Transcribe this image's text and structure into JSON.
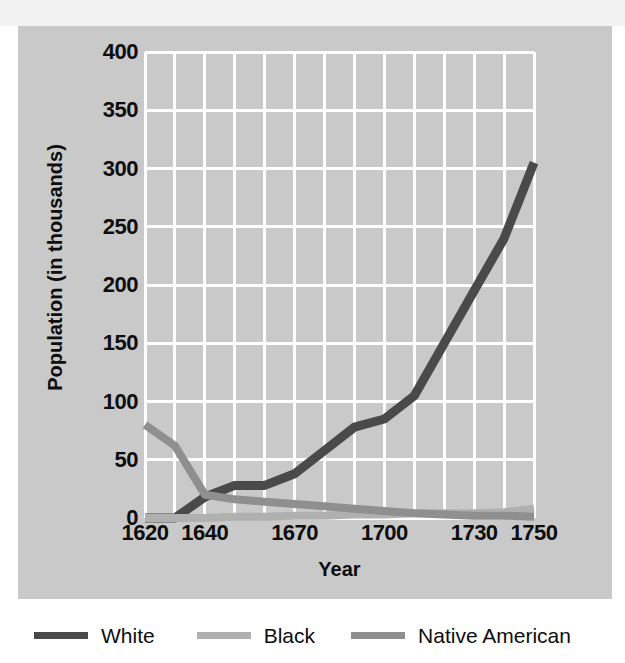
{
  "panel": {
    "background_color": "#c9c9c9",
    "grid_color": "#ffffff",
    "top_band_color": "#f2f2f2"
  },
  "axes": {
    "y_title": "Population (in thousands)",
    "x_title": "Year",
    "y_ticks": [
      "400",
      "350",
      "300",
      "250",
      "200",
      "150",
      "100",
      "50",
      "0"
    ],
    "x_ticks": [
      "1620",
      "1640",
      "1670",
      "1700",
      "1730",
      "1750"
    ]
  },
  "legend": {
    "items": [
      {
        "label": "White",
        "color": "#4a4a4a"
      },
      {
        "label": "Black",
        "color": "#b0b0b0"
      },
      {
        "label": "Native American",
        "color": "#8f8f8f"
      }
    ]
  },
  "chart_data": {
    "type": "line",
    "title": "",
    "xlabel": "Year",
    "ylabel": "Population (in thousands)",
    "xlim": [
      1620,
      1750
    ],
    "ylim": [
      0,
      400
    ],
    "yticks": [
      0,
      50,
      100,
      150,
      200,
      250,
      300,
      350,
      400
    ],
    "xticks": [
      1620,
      1640,
      1670,
      1700,
      1730,
      1750
    ],
    "grid": true,
    "legend_position": "below",
    "series": [
      {
        "name": "White",
        "color": "#4a4a4a",
        "x": [
          1620,
          1630,
          1640,
          1650,
          1660,
          1670,
          1680,
          1690,
          1700,
          1710,
          1720,
          1730,
          1740,
          1750
        ],
        "values": [
          0,
          0,
          18,
          28,
          28,
          38,
          58,
          78,
          85,
          105,
          150,
          195,
          240,
          305
        ]
      },
      {
        "name": "Black",
        "color": "#b0b0b0",
        "x": [
          1620,
          1630,
          1640,
          1650,
          1660,
          1670,
          1680,
          1690,
          1700,
          1710,
          1720,
          1730,
          1740,
          1750
        ],
        "values": [
          0,
          0,
          0,
          1,
          1,
          2,
          2,
          3,
          3,
          4,
          4,
          4,
          5,
          8
        ]
      },
      {
        "name": "Native American",
        "color": "#8f8f8f",
        "x": [
          1620,
          1630,
          1640,
          1650,
          1660,
          1670,
          1680,
          1690,
          1700,
          1710,
          1720,
          1730,
          1740,
          1750
        ],
        "values": [
          80,
          62,
          20,
          16,
          14,
          12,
          10,
          8,
          6,
          4,
          3,
          2,
          2,
          1
        ]
      }
    ]
  }
}
